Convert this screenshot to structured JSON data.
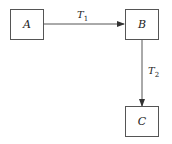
{
  "nodes": [
    {
      "id": "A",
      "label": "A"
    },
    {
      "id": "B",
      "label": "B"
    },
    {
      "id": "C",
      "label": "C"
    }
  ],
  "edges": [
    {
      "from": "A",
      "to": "B",
      "label_main": "T",
      "label_sub": "1"
    },
    {
      "from": "B",
      "to": "C",
      "label_main": "T",
      "label_sub": "2"
    }
  ],
  "colors": {
    "stroke": "#555555",
    "text": "#222222"
  }
}
